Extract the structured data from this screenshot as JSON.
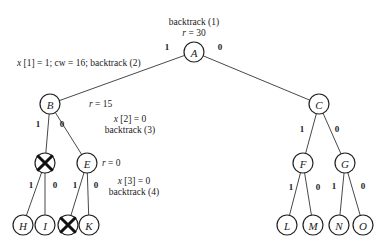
{
  "diagram": {
    "type": "binary-search-tree-backtracking",
    "nodes": [
      {
        "id": "A",
        "label": "A",
        "x": 194,
        "y": 52,
        "pruned": false
      },
      {
        "id": "B",
        "label": "B",
        "x": 50,
        "y": 104,
        "pruned": false
      },
      {
        "id": "C",
        "label": "C",
        "x": 319,
        "y": 104,
        "pruned": false
      },
      {
        "id": "D",
        "label": "",
        "x": 45,
        "y": 163,
        "pruned": true
      },
      {
        "id": "E",
        "label": "E",
        "x": 87,
        "y": 163,
        "pruned": false
      },
      {
        "id": "F",
        "label": "F",
        "x": 303,
        "y": 163,
        "pruned": false
      },
      {
        "id": "G",
        "label": "G",
        "x": 345,
        "y": 163,
        "pruned": false
      },
      {
        "id": "H",
        "label": "H",
        "x": 23,
        "y": 225,
        "pruned": false
      },
      {
        "id": "I",
        "label": "I",
        "x": 45,
        "y": 225,
        "pruned": false
      },
      {
        "id": "J",
        "label": "",
        "x": 68,
        "y": 225,
        "pruned": true
      },
      {
        "id": "K",
        "label": "K",
        "x": 89,
        "y": 225,
        "pruned": false
      },
      {
        "id": "L",
        "label": "L",
        "x": 287,
        "y": 225,
        "pruned": false
      },
      {
        "id": "M",
        "label": "M",
        "x": 313,
        "y": 225,
        "pruned": false
      },
      {
        "id": "N",
        "label": "N",
        "x": 339,
        "y": 225,
        "pruned": false
      },
      {
        "id": "O",
        "label": "O",
        "x": 363,
        "y": 225,
        "pruned": false
      }
    ],
    "edges": [
      {
        "from": "A",
        "to": "B",
        "label": "1",
        "lx": 167,
        "ly": 47
      },
      {
        "from": "A",
        "to": "C",
        "label": "0",
        "lx": 220,
        "ly": 47
      },
      {
        "from": "B",
        "to": "D",
        "label": "1",
        "lx": 38,
        "ly": 124
      },
      {
        "from": "B",
        "to": "E",
        "label": "0",
        "lx": 62,
        "ly": 124
      },
      {
        "from": "C",
        "to": "F",
        "label": "1",
        "lx": 302,
        "ly": 129
      },
      {
        "from": "C",
        "to": "G",
        "label": "0",
        "lx": 337,
        "ly": 129
      },
      {
        "from": "D",
        "to": "H",
        "label": "1",
        "lx": 31,
        "ly": 185
      },
      {
        "from": "D",
        "to": "I",
        "label": "0",
        "lx": 55,
        "ly": 185
      },
      {
        "from": "E",
        "to": "J",
        "label": "1",
        "lx": 75,
        "ly": 185
      },
      {
        "from": "E",
        "to": "K",
        "label": "0",
        "lx": 96,
        "ly": 185
      },
      {
        "from": "F",
        "to": "L",
        "label": "1",
        "lx": 291,
        "ly": 187
      },
      {
        "from": "F",
        "to": "M",
        "label": "0",
        "lx": 318,
        "ly": 187
      },
      {
        "from": "G",
        "to": "N",
        "label": "1",
        "lx": 334,
        "ly": 186
      },
      {
        "from": "G",
        "to": "O",
        "label": "0",
        "lx": 363,
        "ly": 186
      }
    ],
    "annotations": [
      {
        "id": "ann-backtrack-1",
        "text": "backtrack (1)",
        "x": 194,
        "y": 22,
        "anchor": "middle",
        "italic_prefix": ""
      },
      {
        "id": "ann-r30",
        "text": "r = 30",
        "x": 194,
        "y": 33,
        "anchor": "middle"
      },
      {
        "id": "ann-x1",
        "text": "x [1] = 1; cw = 16; backtrack (2)",
        "x": 17,
        "y": 63,
        "anchor": "start"
      },
      {
        "id": "ann-r15",
        "text": "r = 15",
        "x": 89,
        "y": 104,
        "anchor": "start"
      },
      {
        "id": "ann-x2",
        "text": "x [2] = 0",
        "x": 130,
        "y": 119,
        "anchor": "middle"
      },
      {
        "id": "ann-backtrack-3",
        "text": "backtrack (3)",
        "x": 130,
        "y": 130,
        "anchor": "middle"
      },
      {
        "id": "ann-r0",
        "text": "r = 0",
        "x": 102,
        "y": 163,
        "anchor": "start"
      },
      {
        "id": "ann-x3",
        "text": "x [3] = 0",
        "x": 134,
        "y": 181,
        "anchor": "middle"
      },
      {
        "id": "ann-backtrack-4",
        "text": "backtrack (4)",
        "x": 134,
        "y": 192,
        "anchor": "middle"
      }
    ],
    "style": {
      "node_radius": 10,
      "stroke_color": "#222222",
      "background": "#ffffff"
    }
  }
}
